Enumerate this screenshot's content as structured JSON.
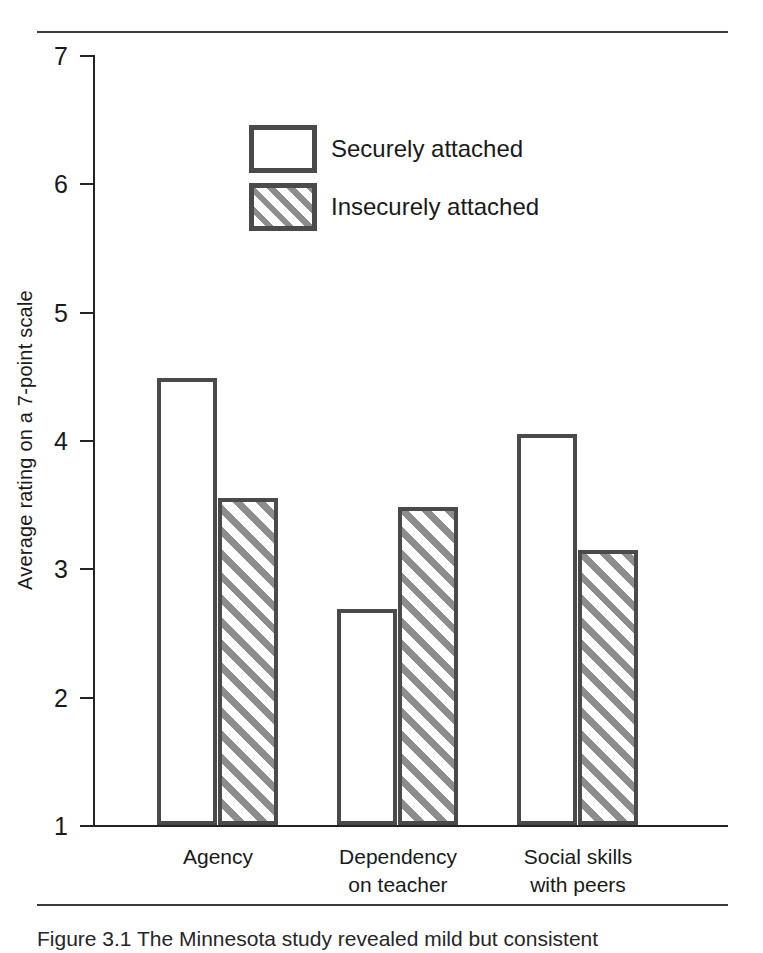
{
  "figure": {
    "background_color": "#ffffff",
    "rule_color": "#3a3a3a",
    "axis_color": "#242424",
    "bar_outline_color": "#4a4a4a",
    "hatch_color": "#8d8d8d"
  },
  "caption": {
    "text": "Figure  3.1    The  Minnesota  study  revealed  mild  but  consistent"
  },
  "chart_data": {
    "type": "bar",
    "title": "",
    "subtitle": "",
    "xlabel": "",
    "ylabel": "Average rating on a 7-point scale",
    "ylim": [
      1,
      7
    ],
    "yticks": [
      1,
      2,
      3,
      4,
      5,
      6,
      7
    ],
    "ytick_labels": [
      "1",
      "2",
      "3",
      "4",
      "5",
      "6",
      "7"
    ],
    "grid": false,
    "legend_position": "upper-left-inside",
    "categories": [
      "Agency",
      "Dependency\non teacher",
      "Social skills\nwith peers"
    ],
    "series": [
      {
        "name": "Securely attached",
        "fill": "white",
        "values": [
          4.48,
          2.68,
          4.05
        ]
      },
      {
        "name": "Insecurely attached",
        "fill": "diagonal-hatch",
        "values": [
          3.55,
          3.48,
          3.14
        ]
      }
    ]
  }
}
